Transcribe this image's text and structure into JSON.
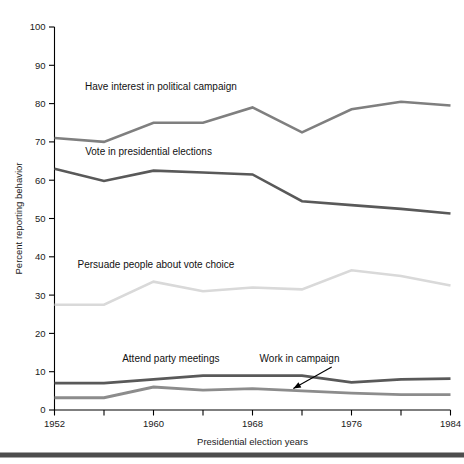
{
  "figure": {
    "background_color": "#ffffff",
    "bottom_rule_color": "#4d4d4d",
    "axis_color": "#000000"
  },
  "chart_data": {
    "type": "line",
    "title": "",
    "subtitle": "",
    "xlabel": "Presidential election years",
    "ylabel": "Percent reporting behavior",
    "xlim": [
      1952,
      1984
    ],
    "ylim": [
      0,
      100
    ],
    "grid": false,
    "legend_position": "inline-annotations",
    "x": [
      1952,
      1956,
      1960,
      1964,
      1968,
      1972,
      1976,
      1980,
      1984
    ],
    "xticks": [
      1952,
      1956,
      1960,
      1964,
      1968,
      1972,
      1976,
      1980,
      1984
    ],
    "xtick_labels": [
      "1952",
      "",
      "1960",
      "",
      "1968",
      "",
      "1976",
      "",
      "1984"
    ],
    "yticks": [
      0,
      10,
      20,
      30,
      40,
      50,
      60,
      70,
      80,
      90,
      100
    ],
    "ytick_labels": [
      "0",
      "10",
      "20",
      "30",
      "40",
      "50",
      "60",
      "70",
      "80",
      "90",
      "100"
    ],
    "series": [
      {
        "name": "Have interest in political campaign",
        "color": "#7f7f7f",
        "width": 2.6,
        "values": [
          71.0,
          70.0,
          75.0,
          75.0,
          79.0,
          72.5,
          78.5,
          80.5,
          79.5
        ],
        "label": "Have interest in political campaign",
        "label_x": 1960.6,
        "label_y": 83.5
      },
      {
        "name": "Vote in presidential elections",
        "color": "#595959",
        "width": 2.6,
        "values": [
          63.0,
          59.8,
          62.5,
          62.0,
          61.5,
          54.5,
          53.5,
          52.5,
          51.3
        ],
        "label": "Vote in presidential elections",
        "label_x": 1959.6,
        "label_y": 66.5
      },
      {
        "name": "Persuade people about vote choice",
        "color": "#d9d9d9",
        "width": 2.6,
        "values": [
          27.5,
          27.5,
          33.5,
          31.0,
          32.0,
          31.5,
          36.5,
          35.0,
          32.5
        ],
        "label": "Persuade people about vote choice",
        "label_x": 1960.2,
        "label_y": 37.0
      },
      {
        "name": "Attend party meetings",
        "color": "#595959",
        "width": 2.8,
        "values": [
          7.0,
          7.0,
          8.0,
          9.0,
          9.0,
          9.0,
          7.2,
          8.0,
          8.2
        ],
        "label": "Attend party meetings",
        "label_x": 1961.4,
        "label_y": 12.6
      },
      {
        "name": "Work in campaign",
        "color": "#8c8c8c",
        "width": 2.8,
        "values": [
          3.2,
          3.2,
          6.0,
          5.2,
          5.6,
          5.0,
          4.4,
          4.0,
          4.0
        ],
        "label": "Work in campaign",
        "label_x": 1971.8,
        "label_y": 12.6
      }
    ],
    "annotations": [
      {
        "name": "work-in-campaign-arrow",
        "text": "",
        "from_x": 1974.4,
        "from_y": 11.2,
        "to_x": 1971.3,
        "to_y": 5.6
      }
    ]
  }
}
